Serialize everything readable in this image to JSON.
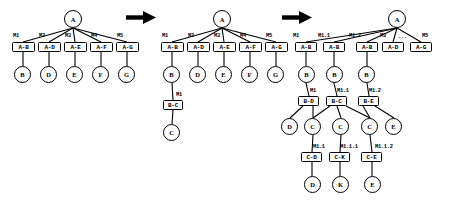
{
  "figure": {
    "title": "",
    "type": "tree-transformation-diagram",
    "panel_count": 3,
    "colors": {
      "stroke": "#000000",
      "fill": "#ffffff",
      "arrow": "#000000"
    }
  },
  "arrows": [
    {
      "name": "arrow-1",
      "glyph": "right-arrow",
      "x": 126,
      "y": 10,
      "w": 30,
      "h": 13
    },
    {
      "name": "arrow-2",
      "glyph": "right-arrow",
      "x": 282,
      "y": 10,
      "w": 30,
      "h": 13
    }
  ],
  "panels": [
    {
      "id": "panel-1",
      "root": {
        "label": "A",
        "x": 64,
        "y": 10,
        "d": 18
      },
      "boxes": [
        {
          "label": "A-B",
          "x": 12,
          "y": 42,
          "w": 23,
          "h": 10
        },
        {
          "label": "A-D",
          "x": 38,
          "y": 42,
          "w": 23,
          "h": 10
        },
        {
          "label": "A-E",
          "x": 64,
          "y": 42,
          "w": 23,
          "h": 10
        },
        {
          "label": "A-F",
          "x": 90,
          "y": 42,
          "w": 23,
          "h": 10
        },
        {
          "label": "A-G",
          "x": 116,
          "y": 42,
          "w": 23,
          "h": 10
        }
      ],
      "leaves": [
        {
          "label": "B",
          "x": 14,
          "y": 66,
          "d": 17
        },
        {
          "label": "D",
          "x": 40,
          "y": 66,
          "d": 17
        },
        {
          "label": "E",
          "x": 66,
          "y": 66,
          "d": 17
        },
        {
          "label": "F",
          "x": 92,
          "y": 66,
          "d": 17
        },
        {
          "label": "G",
          "x": 118,
          "y": 66,
          "d": 17
        }
      ],
      "edge_labels": [
        {
          "text": "M1",
          "x": 13,
          "y": 33
        },
        {
          "text": "M2",
          "x": 39,
          "y": 33
        },
        {
          "text": "M3",
          "x": 65,
          "y": 33
        },
        {
          "text": "M4",
          "x": 91,
          "y": 33
        },
        {
          "text": "M5",
          "x": 117,
          "y": 33
        }
      ]
    },
    {
      "id": "panel-2",
      "root": {
        "label": "A",
        "x": 213,
        "y": 10,
        "d": 18
      },
      "boxes": [
        {
          "label": "A-B",
          "x": 161,
          "y": 42,
          "w": 23,
          "h": 10
        },
        {
          "label": "A-D",
          "x": 187,
          "y": 42,
          "w": 23,
          "h": 10
        },
        {
          "label": "A-E",
          "x": 213,
          "y": 42,
          "w": 23,
          "h": 10
        },
        {
          "label": "A-F",
          "x": 239,
          "y": 42,
          "w": 23,
          "h": 10
        },
        {
          "label": "A-G",
          "x": 265,
          "y": 42,
          "w": 23,
          "h": 10
        },
        {
          "label": "B-C",
          "x": 163,
          "y": 100,
          "w": 20,
          "h": 10
        }
      ],
      "leaves": [
        {
          "label": "B",
          "x": 163,
          "y": 66,
          "d": 17
        },
        {
          "label": "D",
          "x": 189,
          "y": 66,
          "d": 17
        },
        {
          "label": "E",
          "x": 215,
          "y": 66,
          "d": 17
        },
        {
          "label": "F",
          "x": 241,
          "y": 66,
          "d": 17
        },
        {
          "label": "G",
          "x": 267,
          "y": 66,
          "d": 17
        },
        {
          "label": "C",
          "x": 163,
          "y": 124,
          "d": 17
        }
      ],
      "edge_labels": [
        {
          "text": "M1",
          "x": 162,
          "y": 33
        },
        {
          "text": "M2",
          "x": 188,
          "y": 33
        },
        {
          "text": "M3",
          "x": 214,
          "y": 33
        },
        {
          "text": "M4",
          "x": 240,
          "y": 33
        },
        {
          "text": "M5",
          "x": 266,
          "y": 33
        },
        {
          "text": "M1",
          "x": 176,
          "y": 92
        }
      ]
    },
    {
      "id": "panel-3",
      "root": {
        "label": "A",
        "x": 388,
        "y": 10,
        "d": 18
      },
      "boxes": [
        {
          "label": "A-B",
          "x": 295,
          "y": 42,
          "w": 22,
          "h": 10
        },
        {
          "label": "A-B",
          "x": 323,
          "y": 42,
          "w": 22,
          "h": 10
        },
        {
          "label": "A-B",
          "x": 356,
          "y": 42,
          "w": 22,
          "h": 10
        },
        {
          "label": "A-D",
          "x": 382,
          "y": 42,
          "w": 22,
          "h": 10
        },
        {
          "label": "A-G",
          "x": 410,
          "y": 42,
          "w": 22,
          "h": 10
        },
        {
          "label": "B-D",
          "x": 298,
          "y": 96,
          "w": 21,
          "h": 10
        },
        {
          "label": "B-C",
          "x": 326,
          "y": 96,
          "w": 21,
          "h": 10
        },
        {
          "label": "B-E",
          "x": 358,
          "y": 96,
          "w": 21,
          "h": 10
        },
        {
          "label": "C-D",
          "x": 301,
          "y": 152,
          "w": 21,
          "h": 10
        },
        {
          "label": "C-K",
          "x": 329,
          "y": 152,
          "w": 21,
          "h": 10
        },
        {
          "label": "C-E",
          "x": 361,
          "y": 152,
          "w": 21,
          "h": 10
        }
      ],
      "leaves": [
        {
          "label": "B",
          "x": 298,
          "y": 66,
          "d": 17
        },
        {
          "label": "B",
          "x": 326,
          "y": 66,
          "d": 17
        },
        {
          "label": "B",
          "x": 358,
          "y": 66,
          "d": 17
        },
        {
          "label": "D",
          "x": 281,
          "y": 118,
          "d": 17
        },
        {
          "label": "C",
          "x": 304,
          "y": 118,
          "d": 17
        },
        {
          "label": "C",
          "x": 332,
          "y": 118,
          "d": 17
        },
        {
          "label": "C",
          "x": 361,
          "y": 118,
          "d": 17
        },
        {
          "label": "E",
          "x": 385,
          "y": 118,
          "d": 17
        },
        {
          "label": "D",
          "x": 304,
          "y": 176,
          "d": 17
        },
        {
          "label": "K",
          "x": 332,
          "y": 176,
          "d": 17
        },
        {
          "label": "E",
          "x": 364,
          "y": 176,
          "d": 17
        }
      ],
      "edge_labels": [
        {
          "text": "M1",
          "x": 293,
          "y": 33
        },
        {
          "text": "M1.1",
          "x": 318,
          "y": 33
        },
        {
          "text": "M1.2",
          "x": 349,
          "y": 33
        },
        {
          "text": "M3",
          "x": 380,
          "y": 33
        },
        {
          "text": "...",
          "x": 398,
          "y": 34
        },
        {
          "text": "M5",
          "x": 422,
          "y": 33
        },
        {
          "text": "M1",
          "x": 310,
          "y": 88
        },
        {
          "text": "M1.1",
          "x": 337,
          "y": 88
        },
        {
          "text": "M1.2",
          "x": 369,
          "y": 88
        },
        {
          "text": "M1.1",
          "x": 313,
          "y": 144
        },
        {
          "text": "M1.1.1",
          "x": 340,
          "y": 144
        },
        {
          "text": "M1.1.2",
          "x": 375,
          "y": 144
        }
      ]
    }
  ],
  "edges": {
    "panel1": [
      [
        73,
        28,
        23,
        42
      ],
      [
        73,
        28,
        49,
        42
      ],
      [
        73,
        28,
        75,
        42
      ],
      [
        73,
        28,
        101,
        42
      ],
      [
        73,
        28,
        127,
        42
      ],
      [
        23,
        52,
        23,
        66
      ],
      [
        49,
        52,
        49,
        66
      ],
      [
        75,
        52,
        75,
        66
      ],
      [
        101,
        52,
        101,
        66
      ],
      [
        127,
        52,
        127,
        66
      ]
    ],
    "panel2": [
      [
        222,
        28,
        172,
        42
      ],
      [
        222,
        28,
        198,
        42
      ],
      [
        222,
        28,
        224,
        42
      ],
      [
        222,
        28,
        250,
        42
      ],
      [
        222,
        28,
        276,
        42
      ],
      [
        172,
        52,
        172,
        66
      ],
      [
        198,
        52,
        198,
        66
      ],
      [
        224,
        52,
        224,
        66
      ],
      [
        250,
        52,
        250,
        66
      ],
      [
        276,
        52,
        276,
        66
      ],
      [
        172,
        83,
        173,
        100
      ],
      [
        173,
        110,
        172,
        124
      ]
    ],
    "panel3": [
      [
        397,
        28,
        306,
        42
      ],
      [
        397,
        28,
        334,
        42
      ],
      [
        397,
        28,
        367,
        42
      ],
      [
        397,
        28,
        393,
        42
      ],
      [
        397,
        28,
        421,
        42
      ],
      [
        306,
        52,
        306,
        66
      ],
      [
        334,
        52,
        334,
        66
      ],
      [
        367,
        52,
        367,
        66
      ],
      [
        306,
        83,
        309,
        96
      ],
      [
        334,
        83,
        337,
        96
      ],
      [
        367,
        83,
        369,
        96
      ],
      [
        303,
        106,
        290,
        118
      ],
      [
        313,
        106,
        313,
        118
      ],
      [
        330,
        106,
        313,
        118
      ],
      [
        337,
        106,
        341,
        118
      ],
      [
        346,
        106,
        370,
        118
      ],
      [
        363,
        106,
        370,
        118
      ],
      [
        375,
        106,
        394,
        118
      ],
      [
        313,
        135,
        312,
        152
      ],
      [
        341,
        135,
        340,
        152
      ],
      [
        370,
        135,
        372,
        152
      ],
      [
        312,
        162,
        312,
        176
      ],
      [
        340,
        162,
        340,
        176
      ],
      [
        372,
        162,
        372,
        176
      ]
    ]
  }
}
